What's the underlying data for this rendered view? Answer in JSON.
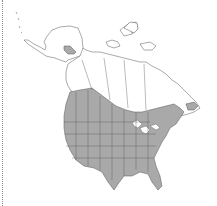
{
  "map": {
    "type": "species-range-map",
    "region": "North America",
    "colors": {
      "background": "#ffffff",
      "land": "#ffffff",
      "range_fill": "#a9a9a9",
      "border": "#555555",
      "frame_rule": "#8a8a8a"
    },
    "legend": [],
    "labels": []
  }
}
